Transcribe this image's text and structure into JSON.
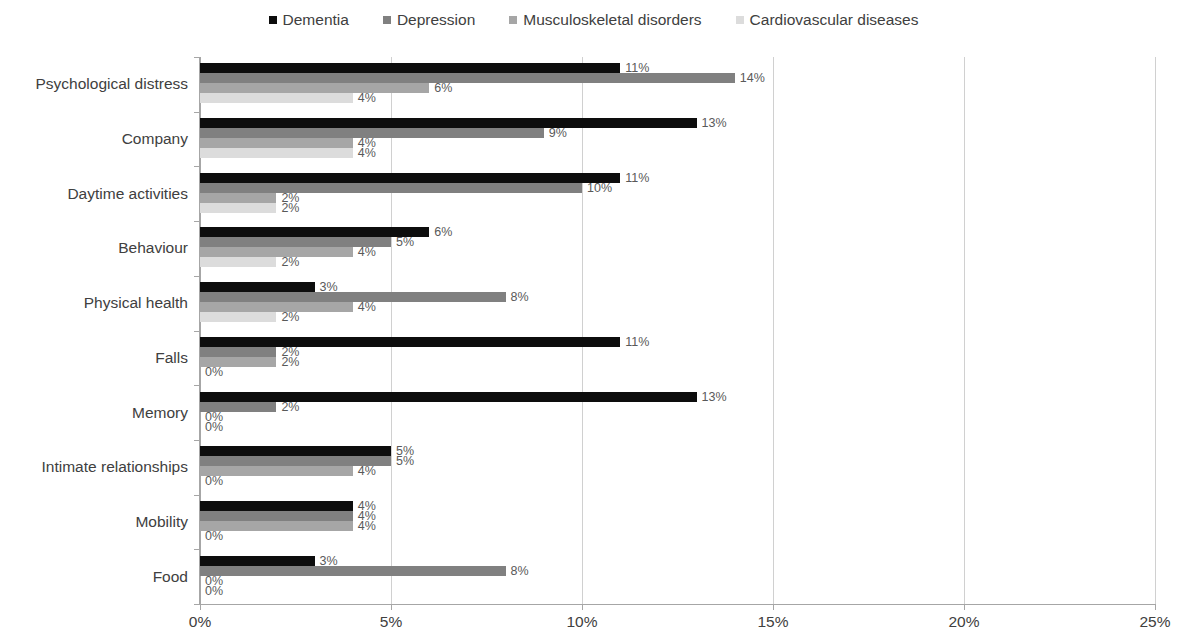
{
  "chart_data": {
    "type": "bar",
    "orientation": "horizontal",
    "title": "",
    "xlabel": "",
    "ylabel": "",
    "xlim": [
      0,
      25
    ],
    "xticks": [
      "0%",
      "5%",
      "10%",
      "15%",
      "20%",
      "25%"
    ],
    "xtick_values": [
      0,
      5,
      10,
      15,
      20,
      25
    ],
    "grid": true,
    "legend_position": "top-center",
    "value_suffix": "%",
    "categories": [
      "Psychological distress",
      "Company",
      "Daytime activities",
      "Behaviour",
      "Physical health",
      "Falls",
      "Memory",
      "Intimate relationships",
      "Mobility",
      "Food"
    ],
    "series": [
      {
        "name": "Dementia",
        "color": "#0d0d0d",
        "values": [
          11,
          13,
          11,
          6,
          3,
          11,
          13,
          5,
          4,
          3
        ],
        "labels": [
          "11%",
          "13%",
          "11%",
          "6%",
          "3%",
          "11%",
          "13%",
          "5%",
          "4%",
          "3%"
        ]
      },
      {
        "name": "Depression",
        "color": "#808080",
        "values": [
          14,
          9,
          10,
          5,
          8,
          2,
          2,
          5,
          4,
          8
        ],
        "labels": [
          "14%",
          "9%",
          "10%",
          "5%",
          "8%",
          "2%",
          "2%",
          "5%",
          "4%",
          "8%"
        ]
      },
      {
        "name": "Musculoskeletal disorders",
        "color": "#a6a6a6",
        "values": [
          6,
          4,
          2,
          4,
          4,
          2,
          0,
          4,
          4,
          0
        ],
        "labels": [
          "6%",
          "4%",
          "2%",
          "4%",
          "4%",
          "2%",
          "0%",
          "4%",
          "4%",
          "0%"
        ]
      },
      {
        "name": "Cardiovascular diseases",
        "color": "#dcdcdc",
        "values": [
          4,
          4,
          2,
          2,
          2,
          0,
          0,
          0,
          0,
          0
        ],
        "labels": [
          "4%",
          "4%",
          "2%",
          "2%",
          "2%",
          "0%",
          "0%",
          "0%",
          "0%",
          "0%"
        ]
      }
    ]
  }
}
